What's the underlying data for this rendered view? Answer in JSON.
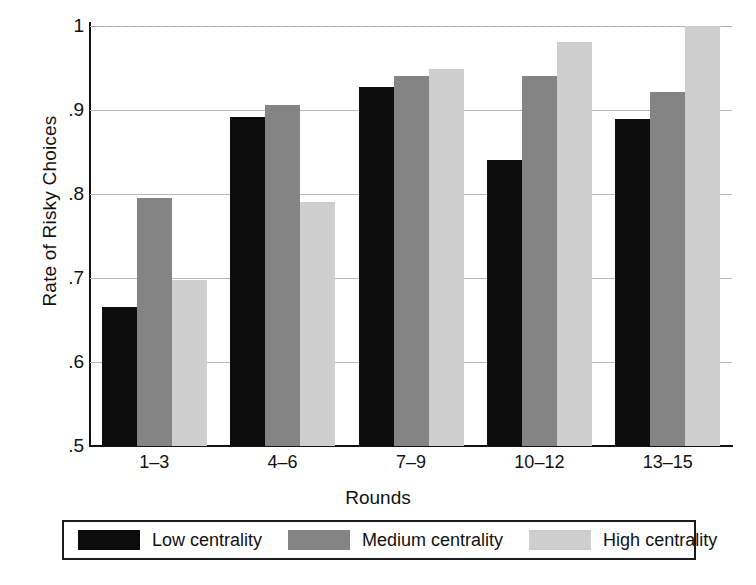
{
  "chart_data": {
    "type": "bar",
    "title": "",
    "xlabel": "Rounds",
    "ylabel": "Rate of Risky Choices",
    "categories": [
      "1–3",
      "4–6",
      "7–9",
      "10–12",
      "13–15"
    ],
    "series": [
      {
        "name": "Low centrality",
        "color": "#0d0d0d",
        "values": [
          0.665,
          0.892,
          0.927,
          0.84,
          0.889
        ]
      },
      {
        "name": "Medium centrality",
        "color": "#848484",
        "values": [
          0.795,
          0.906,
          0.941,
          0.941,
          0.922
        ]
      },
      {
        "name": "High centrality",
        "color": "#cfcfcf",
        "values": [
          0.698,
          0.791,
          0.949,
          0.981,
          1.0
        ]
      }
    ],
    "ylim": [
      0.5,
      1.0
    ],
    "ytick_values": [
      0.5,
      0.6,
      0.7,
      0.8,
      0.9,
      1.0
    ],
    "ytick_labels": [
      ".5",
      ".6",
      ".7",
      ".8",
      ".9",
      "1"
    ],
    "grid": true,
    "grid_axis": "y",
    "legend_position": "bottom",
    "legend_entries": [
      "Low centrality",
      "Medium centrality",
      "High centrality"
    ]
  },
  "legend": {
    "entries": [
      {
        "label": "Low centrality",
        "swatch": "low"
      },
      {
        "label": "Medium centrality",
        "swatch": "medium"
      },
      {
        "label": "High centrality",
        "swatch": "high"
      }
    ]
  }
}
